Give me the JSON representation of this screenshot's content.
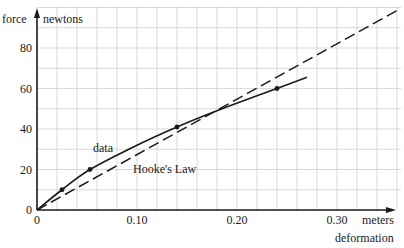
{
  "chart_data": {
    "type": "line",
    "title": "",
    "xlabel": "deformation",
    "xunit": "meters",
    "ylabel": "force",
    "yunit": "newtons",
    "xlim": [
      0,
      0.36
    ],
    "ylim": [
      0,
      100
    ],
    "x_ticks": [
      "0",
      "0.10",
      "0.20",
      "0.30"
    ],
    "y_ticks": [
      "0",
      "20",
      "40",
      "60",
      "80"
    ],
    "grid": true,
    "grid_x_step": 0.02,
    "grid_y_step": 10,
    "series": [
      {
        "name": "data",
        "style": "solid",
        "points": [
          [
            0,
            0
          ],
          [
            0.025,
            10
          ],
          [
            0.053,
            20
          ],
          [
            0.14,
            41
          ],
          [
            0.24,
            60
          ]
        ],
        "curve": [
          [
            0,
            0
          ],
          [
            0.025,
            10
          ],
          [
            0.053,
            20
          ],
          [
            0.1,
            32
          ],
          [
            0.14,
            41
          ],
          [
            0.18,
            49
          ],
          [
            0.24,
            60
          ],
          [
            0.27,
            65.5
          ]
        ]
      },
      {
        "name": "Hooke's Law",
        "style": "dashed",
        "points": [
          [
            0,
            0
          ],
          [
            0.36,
            98.5
          ]
        ]
      }
    ],
    "annotations": [
      "data",
      "Hooke's Law"
    ]
  },
  "labels": {
    "y_axis_name": "force",
    "y_axis_unit": "newtons",
    "x_axis_unit": "meters",
    "x_axis_name": "deformation",
    "data_label": "data",
    "hooke_label": "Hooke's Law"
  }
}
